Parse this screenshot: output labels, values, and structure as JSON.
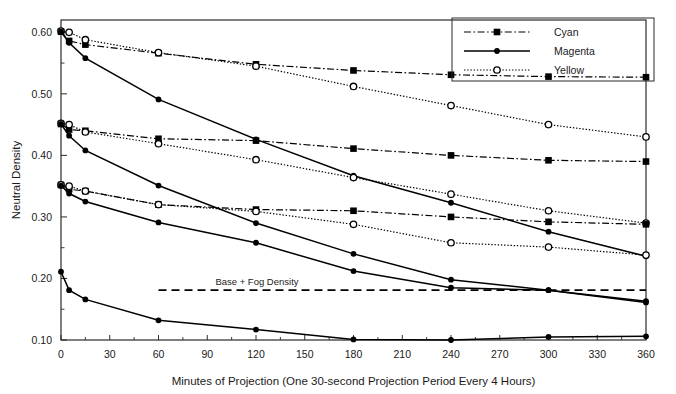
{
  "chart_data": {
    "type": "line",
    "title": "",
    "xlabel": "Minutes of Projection (One 30-second Projection Period Every 4 Hours)",
    "ylabel": "Neutral Density",
    "xlim": [
      0,
      360
    ],
    "ylim": [
      0.1,
      0.62
    ],
    "xticks": [
      0,
      30,
      60,
      90,
      120,
      150,
      180,
      210,
      240,
      270,
      300,
      330,
      360
    ],
    "xtick_labels": [
      "0",
      "30",
      "60",
      "90",
      "120",
      "150",
      "180",
      "210",
      "240",
      "270",
      "300",
      "330",
      "360"
    ],
    "yticks": [
      0.1,
      0.2,
      0.3,
      0.4,
      0.5,
      0.6
    ],
    "ytick_labels": [
      "0.10",
      "0.20",
      "0.30",
      "0.40",
      "0.50",
      "0.60"
    ],
    "yticks_minor": [
      0.15,
      0.25,
      0.35,
      0.45,
      0.55
    ],
    "grid": false,
    "legend_position": "top-right",
    "legend": [
      {
        "name": "Cyan",
        "dash": "dashdot",
        "marker": "filled-square"
      },
      {
        "name": "Magenta",
        "dash": "solid",
        "marker": "filled-circle"
      },
      {
        "name": "Yellow",
        "dash": "dotted",
        "marker": "open-circle"
      }
    ],
    "annotations": [
      {
        "text": "Base + Fog Density",
        "y": 0.181,
        "x_text": 95,
        "line": "dashed",
        "x_start": 60,
        "x_end": 360
      }
    ],
    "series": [
      {
        "name": "Cyan 0.60",
        "color_name": "Cyan",
        "dash": "dashdot",
        "marker": "filled-square",
        "x": [
          0,
          5,
          15,
          60,
          120,
          180,
          240,
          300,
          360
        ],
        "y": [
          0.601,
          0.586,
          0.58,
          0.566,
          0.548,
          0.538,
          0.531,
          0.528,
          0.527
        ]
      },
      {
        "name": "Yellow 0.60",
        "color_name": "Yellow",
        "dash": "dotted",
        "marker": "open-circle",
        "x": [
          0,
          5,
          15,
          60,
          120,
          180,
          240,
          300,
          360
        ],
        "y": [
          0.602,
          0.6,
          0.588,
          0.567,
          0.545,
          0.512,
          0.481,
          0.45,
          0.43
        ]
      },
      {
        "name": "Magenta 0.60",
        "color_name": "Magenta",
        "dash": "solid",
        "marker": "filled-circle",
        "x": [
          0,
          5,
          15,
          60,
          120,
          180,
          240,
          300,
          360
        ],
        "y": [
          0.601,
          0.583,
          0.558,
          0.491,
          0.426,
          0.367,
          0.323,
          0.276,
          0.236
        ]
      },
      {
        "name": "Cyan 0.45",
        "color_name": "Cyan",
        "dash": "dashdot",
        "marker": "filled-square",
        "x": [
          0,
          5,
          15,
          60,
          120,
          180,
          240,
          300,
          360
        ],
        "y": [
          0.451,
          0.442,
          0.44,
          0.427,
          0.424,
          0.411,
          0.4,
          0.392,
          0.39
        ]
      },
      {
        "name": "Yellow 0.45",
        "color_name": "Yellow",
        "dash": "dotted",
        "marker": "open-circle",
        "x": [
          0,
          5,
          15,
          60,
          120,
          180,
          240,
          300,
          360
        ],
        "y": [
          0.452,
          0.45,
          0.438,
          0.419,
          0.393,
          0.364,
          0.337,
          0.31,
          0.29
        ]
      },
      {
        "name": "Magenta 0.45",
        "color_name": "Magenta",
        "dash": "solid",
        "marker": "filled-circle",
        "x": [
          0,
          5,
          15,
          60,
          120,
          180,
          240,
          300,
          360
        ],
        "y": [
          0.451,
          0.432,
          0.408,
          0.351,
          0.29,
          0.24,
          0.198,
          0.181,
          0.161
        ]
      },
      {
        "name": "Cyan 0.35",
        "color_name": "Cyan",
        "dash": "dashdot",
        "marker": "filled-square",
        "x": [
          0,
          5,
          15,
          60,
          120,
          180,
          240,
          300,
          360
        ],
        "y": [
          0.352,
          0.345,
          0.342,
          0.32,
          0.312,
          0.31,
          0.3,
          0.292,
          0.288
        ]
      },
      {
        "name": "Yellow 0.35",
        "color_name": "Yellow",
        "dash": "dotted",
        "marker": "open-circle",
        "x": [
          0,
          5,
          15,
          60,
          120,
          180,
          240,
          300,
          360
        ],
        "y": [
          0.352,
          0.35,
          0.342,
          0.32,
          0.309,
          0.288,
          0.258,
          0.251,
          0.238
        ]
      },
      {
        "name": "Magenta 0.35",
        "color_name": "Magenta",
        "dash": "solid",
        "marker": "filled-circle",
        "x": [
          0,
          5,
          15,
          60,
          120,
          180,
          240,
          300,
          360
        ],
        "y": [
          0.351,
          0.338,
          0.325,
          0.291,
          0.258,
          0.212,
          0.185,
          0.181,
          0.163
        ]
      },
      {
        "name": "Magenta base",
        "color_name": "Magenta",
        "dash": "solid",
        "marker": "filled-circle",
        "x": [
          0,
          5,
          15,
          60,
          120,
          180,
          240,
          300,
          360
        ],
        "y": [
          0.211,
          0.181,
          0.166,
          0.132,
          0.117,
          0.101,
          0.1,
          0.105,
          0.106
        ]
      }
    ]
  }
}
